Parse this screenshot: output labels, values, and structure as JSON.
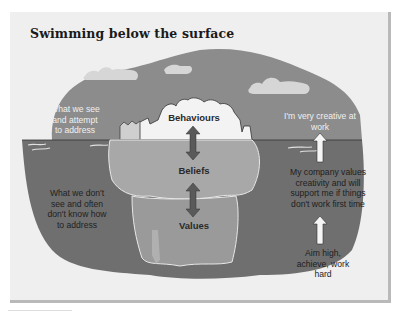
{
  "title": "Swimming below the surface",
  "layers": {
    "behaviours": "Behaviours",
    "beliefs": "Beliefs",
    "values": "Values"
  },
  "left_labels": {
    "above": "What we see and attempt to address",
    "below": "What we don't see and often don't know how to address"
  },
  "right_labels": {
    "top": "I'm very creative at work",
    "middle": "My company values creativity and will support me if things don't work first time",
    "bottom": "Aim high, achieve, work hard"
  },
  "colors": {
    "sky": "#8c8c8c",
    "water": "#6f6f6f",
    "ice_above": "#f3f3f3",
    "ice_below": "#a8a8a8",
    "ice_deep": "#9a9a9a",
    "arrow": "#5a5a5a",
    "panel": "#efefef"
  }
}
